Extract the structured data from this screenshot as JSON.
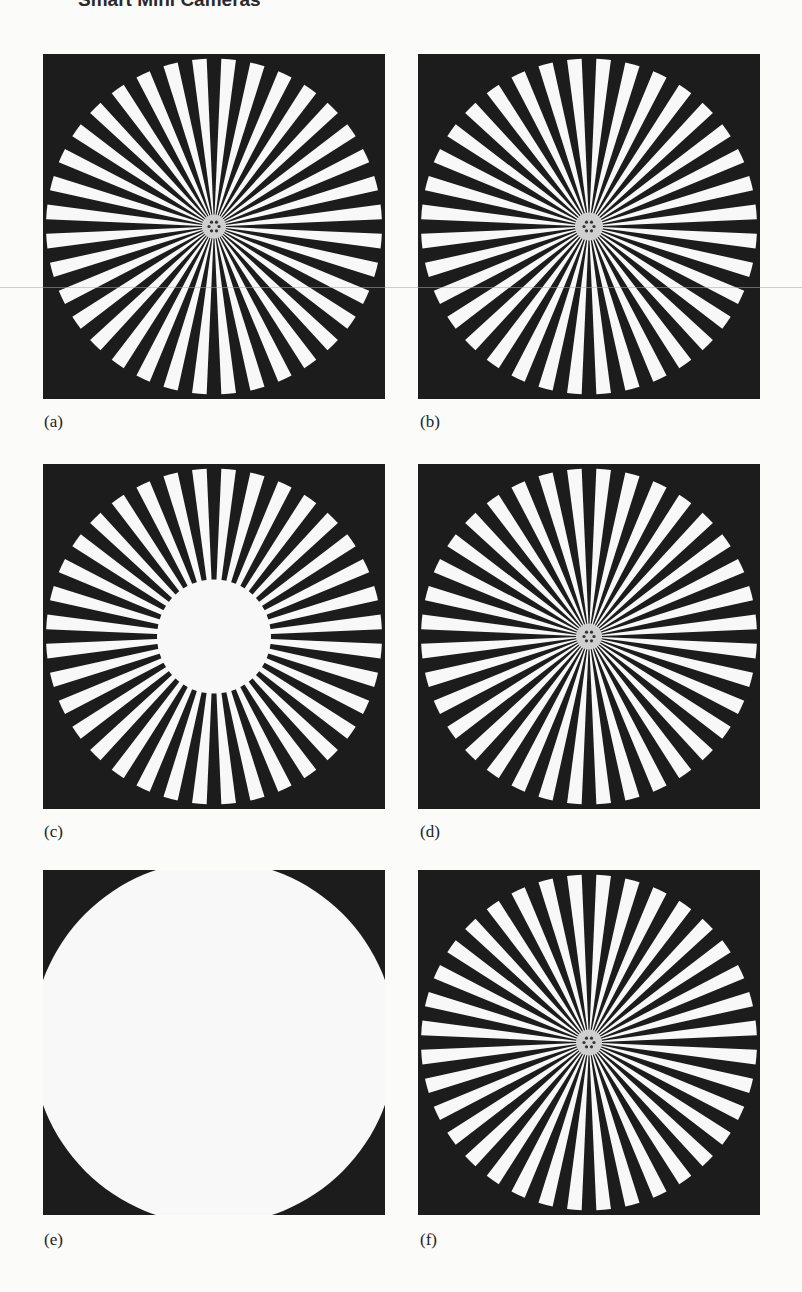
{
  "running_head": {
    "title": "Smart Mini Cameras"
  },
  "figure": {
    "colors": {
      "background": "#1c1c1c",
      "spoke": "#f8f8f8",
      "page": "#fbfbfa"
    },
    "panels": [
      {
        "id": "a",
        "label": "(a)",
        "spokes": 36,
        "center_blur_radius": 12,
        "type": "star"
      },
      {
        "id": "b",
        "label": "(b)",
        "spokes": 36,
        "center_blur_radius": 14,
        "type": "star"
      },
      {
        "id": "c",
        "label": "(c)",
        "spokes": 36,
        "center_blur_radius": 57,
        "type": "star-center-washout"
      },
      {
        "id": "d",
        "label": "(d)",
        "spokes": 36,
        "center_blur_radius": 13,
        "type": "star"
      },
      {
        "id": "e",
        "label": "(e)",
        "spokes": 36,
        "center_blur_radius": 175,
        "type": "washout"
      },
      {
        "id": "f",
        "label": "(f)",
        "spokes": 36,
        "center_blur_radius": 13,
        "type": "star"
      }
    ]
  }
}
